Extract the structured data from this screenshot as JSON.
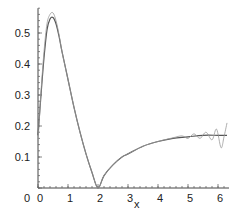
{
  "chart_data": {
    "type": "line",
    "title": "",
    "xlabel": "x",
    "ylabel": "",
    "xlim": [
      0,
      6.3
    ],
    "ylim": [
      0,
      0.58
    ],
    "grid": false,
    "x_ticks": [
      0,
      1,
      2,
      3,
      4,
      5,
      6
    ],
    "x_tick_labels": [
      "0",
      "1",
      "2",
      "3",
      "4",
      "5",
      "6"
    ],
    "y_ticks": [
      0,
      0.1,
      0.2,
      0.3,
      0.4,
      0.5
    ],
    "y_tick_labels": [
      "0",
      "0.1",
      "0.2",
      "0.3",
      "0.4",
      "0.5"
    ],
    "series": [
      {
        "name": "smooth",
        "x": [
          0,
          0.1,
          0.2,
          0.3,
          0.4,
          0.5,
          0.6,
          0.7,
          0.8,
          1.0,
          1.2,
          1.4,
          1.6,
          1.8,
          2.0,
          2.2,
          2.5,
          2.8,
          3.0,
          3.5,
          4.0,
          4.5,
          5.0,
          5.5,
          6.0,
          6.3
        ],
        "y": [
          0.17,
          0.3,
          0.42,
          0.51,
          0.545,
          0.55,
          0.53,
          0.49,
          0.44,
          0.35,
          0.26,
          0.18,
          0.11,
          0.05,
          0.0,
          0.04,
          0.075,
          0.1,
          0.11,
          0.135,
          0.15,
          0.16,
          0.165,
          0.17,
          0.17,
          0.17
        ]
      },
      {
        "name": "oscillating",
        "x": [
          0,
          0.1,
          0.2,
          0.3,
          0.4,
          0.5,
          0.6,
          0.7,
          0.8,
          1.0,
          1.2,
          1.4,
          1.6,
          1.8,
          2.0,
          2.2,
          2.5,
          2.8,
          3.0,
          3.5,
          4.0,
          4.5,
          4.8,
          5.0,
          5.2,
          5.4,
          5.6,
          5.8,
          5.95,
          6.1,
          6.2,
          6.3
        ],
        "y": [
          0.15,
          0.31,
          0.44,
          0.53,
          0.56,
          0.565,
          0.54,
          0.495,
          0.44,
          0.35,
          0.26,
          0.18,
          0.11,
          0.05,
          0.0,
          0.04,
          0.075,
          0.1,
          0.11,
          0.135,
          0.15,
          0.162,
          0.168,
          0.16,
          0.175,
          0.16,
          0.18,
          0.155,
          0.19,
          0.13,
          0.165,
          0.21
        ]
      }
    ]
  }
}
